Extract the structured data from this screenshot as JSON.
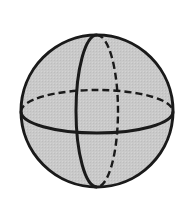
{
  "diagram": {
    "title": "Sphere with equator and meridian",
    "sphere": {
      "cx": 97,
      "cy": 111,
      "r": 76,
      "fill": "#c8c8c8",
      "stroke": "#1a1a1a"
    },
    "equator": {
      "cx": 97,
      "cy": 111.5,
      "rx": 76,
      "ry": 21.5,
      "front": "solid",
      "back": "dashed"
    },
    "meridian": {
      "cx": 97,
      "cy": 111,
      "rx": 21,
      "ry": 76,
      "front": "solid",
      "back": "dashed"
    },
    "colors": {
      "fill": "#c8c8c8",
      "line": "#1a1a1a",
      "background": "#ffffff"
    }
  }
}
